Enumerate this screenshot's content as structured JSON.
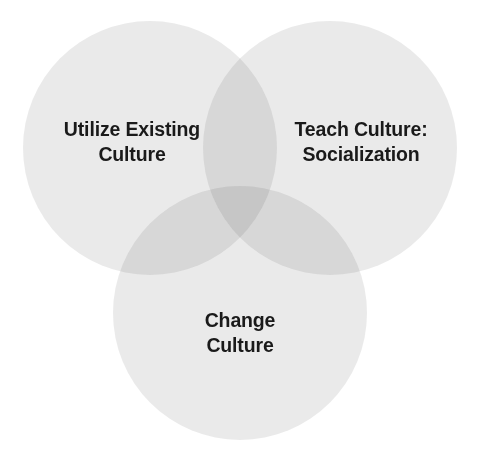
{
  "diagram": {
    "type": "venn",
    "set_count": 3,
    "background_color": "#ffffff",
    "circle_fill_color": "#dddddd",
    "circle_fill_opacity": "0.55",
    "single_region_color": "#eeeeee",
    "pairwise_overlap_color": "#dcdcdc",
    "triple_overlap_color": "#cacaca",
    "label_color": "#1a1a1a",
    "circles": [
      {
        "id": "utilize-existing-culture",
        "label": "Utilize Existing\nCulture",
        "label_line_1": "Utilize Existing",
        "label_line_2": "Culture",
        "position": "top-left",
        "cx": 150,
        "cy": 148,
        "r": 127
      },
      {
        "id": "teach-culture-socialization",
        "label": "Teach Culture:\nSocialization",
        "label_line_1": "Teach Culture:",
        "label_line_2": "Socialization",
        "position": "top-right",
        "cx": 330,
        "cy": 148,
        "r": 127
      },
      {
        "id": "change-culture",
        "label": "Change\nCulture",
        "label_line_1": "Change",
        "label_line_2": "Culture",
        "position": "bottom-center",
        "cx": 240,
        "cy": 313,
        "r": 127
      }
    ]
  }
}
